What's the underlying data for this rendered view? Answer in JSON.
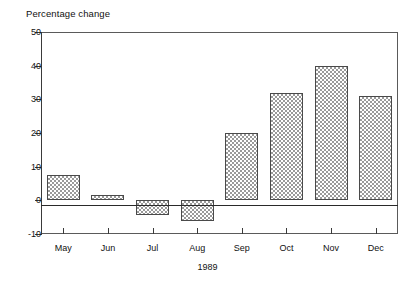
{
  "chart_data": {
    "type": "bar",
    "title": "Percentage change",
    "xlabel": "1989",
    "ylabel": "",
    "categories": [
      "May",
      "Jun",
      "Jul",
      "Aug",
      "Sep",
      "Oct",
      "Nov",
      "Dec"
    ],
    "values": [
      7.5,
      1.5,
      -4.5,
      -6,
      20,
      32,
      40,
      31
    ],
    "ylim": [
      -10,
      50
    ],
    "yticks": [
      50,
      40,
      30,
      20,
      10,
      0,
      -10
    ],
    "ytick_labels": [
      "50",
      "40",
      "30",
      "20",
      "10",
      "0",
      "-10"
    ],
    "grid": false,
    "legend": null,
    "zero_line": 0,
    "bar_fill": "cross-hatch",
    "colors": {
      "bar_outline": "#4a4a4a",
      "bar_hatch": "#9a9a9a",
      "axis": "#3a3a3a",
      "text": "#111111",
      "background": "#ffffff"
    }
  }
}
